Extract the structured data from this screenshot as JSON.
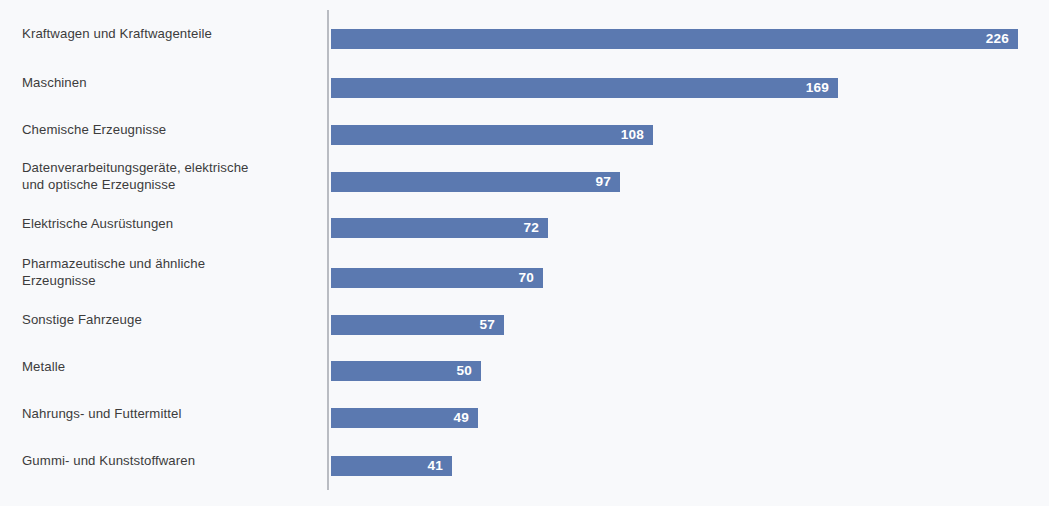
{
  "chart_data": {
    "type": "bar",
    "orientation": "horizontal",
    "title": "",
    "subtitle": "",
    "xlabel": "",
    "ylabel": "",
    "grid": false,
    "legend": null,
    "axis": {
      "visible_spine": "left",
      "ticks": [],
      "xlim": [
        0,
        226
      ]
    },
    "colors": {
      "bar": "#5b79b0",
      "value_label": "#ffffff",
      "category_label": "#3c3c3c",
      "axis": "#b9bcc2",
      "background": "#f8f9fb"
    },
    "categories": [
      "Kraftwagen und Kraftwagenteile",
      "Maschinen",
      "Chemische Erzeugnisse",
      "Datenverarbeitungsgeräte, elektrische\nund optische Erzeugnisse",
      "Elektrische Ausrüstungen",
      "Pharmazeutische und ähnliche\nErzeugnisse",
      "Sonstige Fahrzeuge",
      "Metalle",
      "Nahrungs- und Futtermittel",
      "Gummi- und Kunststoffwaren"
    ],
    "values": [
      226,
      169,
      108,
      97,
      72,
      70,
      57,
      50,
      49,
      41
    ],
    "value_labels": [
      "226",
      "169",
      "108",
      "97",
      "72",
      "70",
      "57",
      "50",
      "49",
      "41"
    ]
  },
  "bars": [
    {
      "label": "Kraftwagen und Kraftwagenteile",
      "value": 226,
      "value_label": "226",
      "top": 29,
      "width": 687,
      "label_top": 25
    },
    {
      "label": "Maschinen",
      "value": 169,
      "value_label": "169",
      "top": 78,
      "width": 507,
      "label_top": 74
    },
    {
      "label": "Chemische Erzeugnisse",
      "value": 108,
      "value_label": "108",
      "top": 125,
      "width": 322,
      "label_top": 121
    },
    {
      "label": "Datenverarbeitungsgeräte, elektrische\nund optische Erzeugnisse",
      "value": 97,
      "value_label": "97",
      "top": 172,
      "width": 289,
      "label_top": 159
    },
    {
      "label": "Elektrische Ausrüstungen",
      "value": 72,
      "value_label": "72",
      "top": 218,
      "width": 217,
      "label_top": 215
    },
    {
      "label": "Pharmazeutische und ähnliche\nErzeugnisse",
      "value": 70,
      "value_label": "70",
      "top": 268,
      "width": 212,
      "label_top": 255
    },
    {
      "label": "Sonstige Fahrzeuge",
      "value": 57,
      "value_label": "57",
      "top": 315,
      "width": 173,
      "label_top": 311
    },
    {
      "label": "Metalle",
      "value": 50,
      "value_label": "50",
      "top": 361,
      "width": 150,
      "label_top": 358
    },
    {
      "label": "Nahrungs- und Futtermittel",
      "value": 49,
      "value_label": "49",
      "top": 408,
      "width": 147,
      "label_top": 405
    },
    {
      "label": "Gummi- und Kunststoffwaren",
      "value": 41,
      "value_label": "41",
      "top": 456,
      "width": 121,
      "label_top": 452
    }
  ]
}
